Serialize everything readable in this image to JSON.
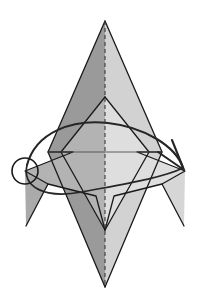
{
  "figure": {
    "type": "origami-diagram",
    "canvas": {
      "width": 201,
      "height": 306
    },
    "background_color": "#ffffff"
  },
  "colors": {
    "stroke": "#1a1a1a",
    "paper_dark": "#9a9a9a",
    "paper_medium": "#b3b3b3",
    "paper_light": "#d2d2d2",
    "paper_lighter": "#dedede",
    "paper_white": "#f2f2f2",
    "fold_line": "#4d4d4d",
    "arrow": "#262626",
    "marker_circle": "#1a1a1a"
  },
  "shapes": {
    "body_left": {
      "name": "left-kite-face",
      "fill": "#9a9a9a",
      "points": "105,21 48,152 105,287"
    },
    "body_right": {
      "name": "right-kite-face",
      "fill": "#d2d2d2",
      "points": "105,21 162,152 105,287"
    },
    "inner_left": {
      "name": "inner-left-flap",
      "fill": "#b3b3b3",
      "points": "105,97 61,152 105,230"
    },
    "inner_right": {
      "name": "inner-right-flap",
      "fill": "#dedede",
      "points": "105,97 149,152 105,230"
    },
    "left_wing": {
      "name": "left-wing-flap",
      "fill": "#b3b3b3",
      "points": "25,171 73,152 96,196 48,184"
    },
    "left_spike": {
      "name": "left-wing-spike",
      "fill": "#aaaaaa",
      "points": "25,171 48,184 26,226"
    },
    "right_wing": {
      "name": "right-wing-flap",
      "fill": "#dedede",
      "points": "185,171 137,152 114,196 162,184"
    },
    "right_spike": {
      "name": "right-wing-spike",
      "fill": "#d6d6d6",
      "points": "185,171 162,184 184,226"
    }
  },
  "lines": {
    "center_fold": {
      "name": "center-mountain-fold",
      "style": "dashed",
      "from": [
        105,
        21
      ],
      "to": [
        105,
        287
      ]
    },
    "horizontal_crease": {
      "name": "horizontal-crease",
      "style": "solid",
      "from": [
        48,
        152
      ],
      "to": [
        162,
        152
      ]
    }
  },
  "annotations": {
    "arc_arrow": {
      "name": "fold-arrow",
      "description": "curved arrow sweeping from left marker over the top to the right wing tip",
      "head_at": [
        183,
        168
      ],
      "direction": "left-to-right-over-top"
    },
    "marker_circle": {
      "name": "reference-point-circle",
      "center": [
        25,
        171
      ],
      "radius": 13
    }
  }
}
